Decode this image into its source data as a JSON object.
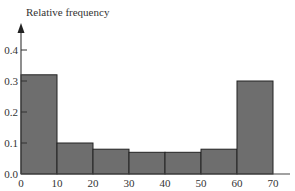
{
  "chart_data": {
    "type": "bar",
    "title": "",
    "xlabel": "",
    "ylabel": "Relative frequency",
    "bins": [
      {
        "start": 0,
        "end": 10,
        "value": 0.32
      },
      {
        "start": 10,
        "end": 20,
        "value": 0.1
      },
      {
        "start": 20,
        "end": 30,
        "value": 0.08
      },
      {
        "start": 30,
        "end": 40,
        "value": 0.07
      },
      {
        "start": 40,
        "end": 50,
        "value": 0.07
      },
      {
        "start": 50,
        "end": 60,
        "value": 0.08
      },
      {
        "start": 60,
        "end": 70,
        "value": 0.3
      }
    ],
    "categories": [
      "0-10",
      "10-20",
      "20-30",
      "30-40",
      "40-50",
      "50-60",
      "60-70"
    ],
    "values": [
      0.32,
      0.1,
      0.08,
      0.07,
      0.07,
      0.08,
      0.3
    ],
    "xticks": [
      "0",
      "10",
      "20",
      "30",
      "40",
      "50",
      "60",
      "70"
    ],
    "yticks": [
      "0.0",
      "0.1",
      "0.2",
      "0.3",
      "0.4"
    ],
    "xlim": [
      0,
      70
    ],
    "ylim": [
      0,
      0.45
    ],
    "grid": false,
    "legend": null,
    "bar_color": "#6e6e6e",
    "bar_edge_color": "#222222"
  }
}
